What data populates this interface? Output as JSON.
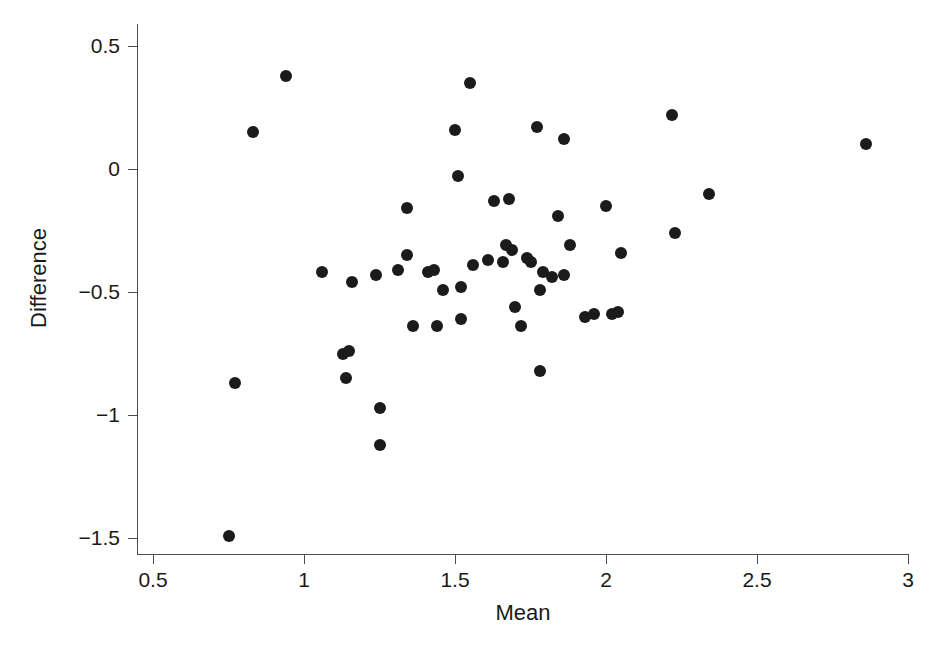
{
  "chart_data": {
    "type": "scatter",
    "title": "",
    "xlabel": "Mean",
    "ylabel": "Difference",
    "xlim": [
      0.37,
      3.05
    ],
    "ylim": [
      -1.6,
      0.58
    ],
    "xticks": [
      0.5,
      1,
      1.5,
      2,
      2.5,
      3
    ],
    "xticklabels": [
      "0.5",
      "1",
      "1.5",
      "2",
      "2.5",
      "3"
    ],
    "yticks": [
      0.5,
      0,
      -0.5,
      -1,
      -1.5
    ],
    "yticklabels": [
      "0.5",
      "0",
      "−0.5",
      "−1",
      "−1.5"
    ],
    "grid": false,
    "legend": null,
    "marker": "filled-circle",
    "marker_color": "#1b1b1b",
    "marker_size": 12,
    "n_points": 55,
    "points": [
      {
        "x": 0.75,
        "y": -1.49
      },
      {
        "x": 0.77,
        "y": -0.87
      },
      {
        "x": 0.83,
        "y": 0.15
      },
      {
        "x": 0.94,
        "y": 0.38
      },
      {
        "x": 1.06,
        "y": -0.42
      },
      {
        "x": 1.13,
        "y": -0.75
      },
      {
        "x": 1.15,
        "y": -0.74
      },
      {
        "x": 1.14,
        "y": -0.85
      },
      {
        "x": 1.16,
        "y": -0.46
      },
      {
        "x": 1.25,
        "y": -0.97
      },
      {
        "x": 1.25,
        "y": -1.12
      },
      {
        "x": 1.24,
        "y": -0.43
      },
      {
        "x": 1.31,
        "y": -0.41
      },
      {
        "x": 1.34,
        "y": -0.16
      },
      {
        "x": 1.34,
        "y": -0.35
      },
      {
        "x": 1.36,
        "y": -0.64
      },
      {
        "x": 1.43,
        "y": -0.41
      },
      {
        "x": 1.44,
        "y": -0.64
      },
      {
        "x": 1.46,
        "y": -0.49
      },
      {
        "x": 1.5,
        "y": 0.16
      },
      {
        "x": 1.51,
        "y": -0.03
      },
      {
        "x": 1.52,
        "y": -0.61
      },
      {
        "x": 1.55,
        "y": 0.35
      },
      {
        "x": 1.56,
        "y": -0.39
      },
      {
        "x": 1.63,
        "y": -0.13
      },
      {
        "x": 1.66,
        "y": -0.38
      },
      {
        "x": 1.68,
        "y": -0.12
      },
      {
        "x": 1.67,
        "y": -0.31
      },
      {
        "x": 1.69,
        "y": -0.33
      },
      {
        "x": 1.7,
        "y": -0.56
      },
      {
        "x": 1.72,
        "y": -0.64
      },
      {
        "x": 1.74,
        "y": -0.36
      },
      {
        "x": 1.75,
        "y": -0.38
      },
      {
        "x": 1.77,
        "y": 0.17
      },
      {
        "x": 1.78,
        "y": -0.49
      },
      {
        "x": 1.78,
        "y": -0.82
      },
      {
        "x": 1.79,
        "y": -0.42
      },
      {
        "x": 1.82,
        "y": -0.44
      },
      {
        "x": 1.84,
        "y": -0.19
      },
      {
        "x": 1.86,
        "y": 0.12
      },
      {
        "x": 1.86,
        "y": -0.43
      },
      {
        "x": 1.88,
        "y": -0.31
      },
      {
        "x": 1.96,
        "y": -0.59
      },
      {
        "x": 2.0,
        "y": -0.15
      },
      {
        "x": 2.02,
        "y": -0.59
      },
      {
        "x": 2.04,
        "y": -0.58
      },
      {
        "x": 2.05,
        "y": -0.34
      },
      {
        "x": 2.22,
        "y": 0.22
      },
      {
        "x": 2.23,
        "y": -0.26
      },
      {
        "x": 2.34,
        "y": -0.1
      },
      {
        "x": 2.86,
        "y": 0.1
      },
      {
        "x": 1.41,
        "y": -0.42
      },
      {
        "x": 1.61,
        "y": -0.37
      },
      {
        "x": 1.93,
        "y": -0.6
      },
      {
        "x": 1.52,
        "y": -0.48
      }
    ]
  }
}
